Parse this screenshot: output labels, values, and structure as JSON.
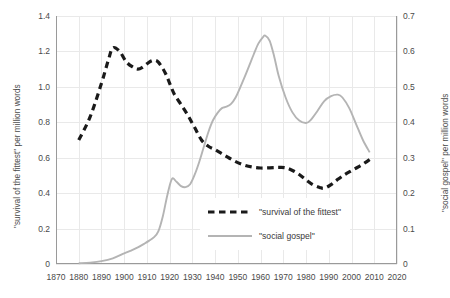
{
  "chart_data": {
    "type": "line",
    "title": "",
    "xlabel": "",
    "ylabel": "\"survival of the fittest\" per million words",
    "ylabel_right": "\"social gospel\" per million words",
    "xlim": [
      1870,
      2020
    ],
    "ylim": [
      0,
      1.4
    ],
    "ylim_right": [
      0,
      0.7
    ],
    "grid": true,
    "legend_position": "center-right-inside",
    "xticks": [
      1870,
      1880,
      1890,
      1900,
      1910,
      1920,
      1930,
      1940,
      1950,
      1960,
      1970,
      1980,
      1990,
      2000,
      2010,
      2020
    ],
    "yticks_left": [
      "0",
      "0.2",
      "0.4",
      "0.6",
      "0.8",
      "1.0",
      "1.2",
      "1.4"
    ],
    "yticks_right": [
      "0",
      "0.1",
      "0.2",
      "0.3",
      "0.4",
      "0.5",
      "0.6",
      "0.7"
    ],
    "series": [
      {
        "name": "\"survival of the fittest\"",
        "axis": "left",
        "style": "dashed",
        "color": "#1a1a1a",
        "x": [
          1880,
          1885,
          1890,
          1893,
          1895,
          1898,
          1901,
          1904,
          1906,
          1908,
          1911,
          1913,
          1915,
          1918,
          1920,
          1922,
          1925,
          1928,
          1931,
          1934,
          1937,
          1940,
          1944,
          1948,
          1952,
          1956,
          1960,
          1964,
          1968,
          1971,
          1974,
          1977,
          1980,
          1983,
          1986,
          1988,
          1991,
          1994,
          1997,
          2000,
          2003,
          2006,
          2008
        ],
        "y": [
          0.7,
          0.83,
          1.02,
          1.15,
          1.22,
          1.2,
          1.14,
          1.11,
          1.1,
          1.11,
          1.14,
          1.15,
          1.14,
          1.08,
          1.02,
          0.96,
          0.9,
          0.84,
          0.77,
          0.7,
          0.665,
          0.645,
          0.615,
          0.585,
          0.562,
          0.548,
          0.542,
          0.543,
          0.545,
          0.543,
          0.528,
          0.505,
          0.475,
          0.448,
          0.432,
          0.428,
          0.448,
          0.478,
          0.505,
          0.527,
          0.548,
          0.572,
          0.59
        ]
      },
      {
        "name": "\"social gospel\"",
        "axis": "right",
        "style": "solid",
        "color": "#b4b4b4",
        "x": [
          1880,
          1885,
          1890,
          1895,
          1900,
          1903,
          1906,
          1909,
          1911,
          1913,
          1915,
          1917,
          1919,
          1921,
          1923,
          1925,
          1927,
          1929,
          1931,
          1933,
          1935,
          1937,
          1939,
          1941,
          1943,
          1945,
          1947,
          1949,
          1951,
          1953,
          1955,
          1957,
          1959,
          1961,
          1962,
          1964,
          1966,
          1968,
          1971,
          1974,
          1977,
          1980,
          1982,
          1985,
          1988,
          1991,
          1994,
          1996,
          1999,
          2002,
          2005,
          2008
        ],
        "y": [
          0.002,
          0.004,
          0.008,
          0.016,
          0.03,
          0.038,
          0.047,
          0.058,
          0.066,
          0.075,
          0.092,
          0.135,
          0.195,
          0.24,
          0.232,
          0.22,
          0.217,
          0.225,
          0.252,
          0.288,
          0.33,
          0.372,
          0.405,
          0.426,
          0.44,
          0.444,
          0.452,
          0.47,
          0.498,
          0.528,
          0.56,
          0.592,
          0.622,
          0.64,
          0.645,
          0.63,
          0.585,
          0.53,
          0.47,
          0.428,
          0.405,
          0.398,
          0.406,
          0.432,
          0.46,
          0.474,
          0.478,
          0.47,
          0.44,
          0.395,
          0.35,
          0.315
        ]
      }
    ]
  },
  "legend": {
    "items": [
      {
        "label": "\"survival of the fittest\"",
        "style": "dashed",
        "color": "#1a1a1a"
      },
      {
        "label": "\"social gospel\"",
        "style": "solid",
        "color": "#b4b4b4"
      }
    ]
  },
  "colors": {
    "grid": "#e9e9e9",
    "axis": "#9a9a9a",
    "text": "#4a4a4a",
    "series_dashed": "#1a1a1a",
    "series_solid": "#b4b4b4"
  }
}
